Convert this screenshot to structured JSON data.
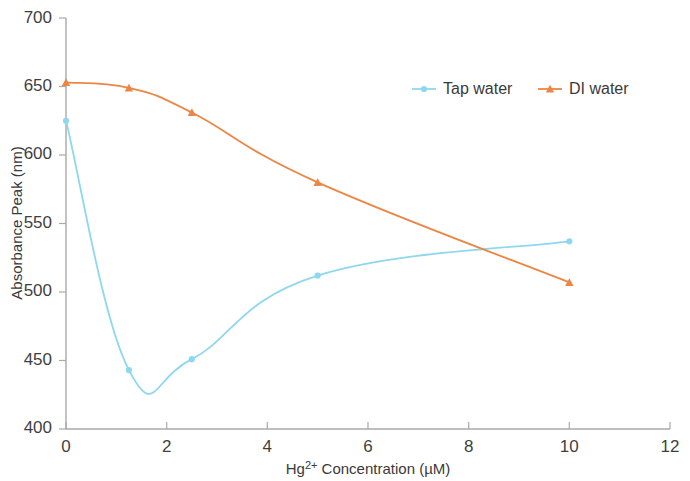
{
  "chart_data": {
    "type": "line",
    "title": "",
    "xlabel": "Hg2+ Concentration (µM)",
    "xlabel_base": "Hg",
    "xlabel_sup": "2+",
    "xlabel_rest": " Concentration (µM)",
    "ylabel": "Absorbance Peak (nm)",
    "xlim": [
      0,
      12
    ],
    "ylim": [
      400,
      700
    ],
    "xticks": [
      "0",
      "2",
      "4",
      "6",
      "8",
      "10",
      "12"
    ],
    "xtick_values": [
      0,
      2,
      4,
      6,
      8,
      10,
      12
    ],
    "yticks": [
      "400",
      "450",
      "500",
      "550",
      "600",
      "650",
      "700"
    ],
    "ytick_values": [
      400,
      450,
      500,
      550,
      600,
      650,
      700
    ],
    "grid": false,
    "legend_position": "top-center",
    "smoothed": true,
    "x": [
      0,
      1.25,
      2.5,
      5,
      10
    ],
    "series": [
      {
        "name": "Tap water",
        "color": "#8ed8ef",
        "marker": "circle",
        "values": [
          625,
          443,
          451,
          512,
          537
        ]
      },
      {
        "name": "DI water",
        "color": "#ed8544",
        "marker": "triangle",
        "values": [
          653,
          649,
          631,
          580,
          507
        ]
      }
    ]
  },
  "legend": {
    "items": [
      {
        "label": "Tap water",
        "color": "#8ed8ef"
      },
      {
        "label": "DI water",
        "color": "#ed8544"
      }
    ]
  },
  "axes": {
    "y_title": "Absorbance Peak (nm)",
    "x_title_base": "Hg",
    "x_title_sup": "2+",
    "x_title_rest": " Concentration (µM)"
  },
  "ticks": {
    "y": [
      "700",
      "650",
      "600",
      "550",
      "500",
      "450",
      "400"
    ],
    "x": [
      "0",
      "2",
      "4",
      "6",
      "8",
      "10",
      "12"
    ]
  }
}
